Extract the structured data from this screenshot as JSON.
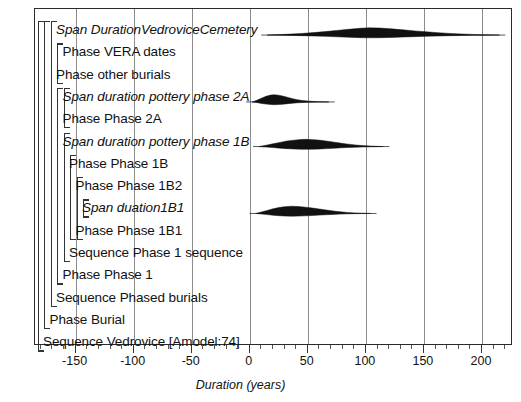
{
  "figure": {
    "kind": "oxcal-span-duration-plot",
    "axis": {
      "title": "Duration (years)",
      "min": -185,
      "max": 225,
      "major_ticks": [
        -150,
        -100,
        -50,
        0,
        50,
        100,
        150,
        200
      ],
      "major_tick_labels": [
        "-150",
        "-100",
        "-50",
        "0",
        "50",
        "100",
        "150",
        "200"
      ],
      "minor_tick_step": 10,
      "gridlines": true,
      "grid_color": "#8d8d8d",
      "frame_color": "#2b2b2b"
    },
    "rows": [
      {
        "label": "Span DurationVedroviceCemetery",
        "italic": true,
        "indent": 2,
        "has_dist": true,
        "dist": 0
      },
      {
        "label": "Phase VERA dates",
        "italic": false,
        "indent": 3,
        "has_dist": false
      },
      {
        "label": "Phase other burials",
        "italic": false,
        "indent": 2,
        "has_dist": false
      },
      {
        "label": "Span duration pottery phase 2A",
        "italic": true,
        "indent": 3,
        "has_dist": true,
        "dist": 1
      },
      {
        "label": "Phase Phase 2A",
        "italic": false,
        "indent": 3,
        "has_dist": false
      },
      {
        "label": "Span duration pottery phase 1B",
        "italic": true,
        "indent": 3,
        "has_dist": true,
        "dist": 2
      },
      {
        "label": "Phase Phase 1B",
        "italic": false,
        "indent": 4,
        "has_dist": false
      },
      {
        "label": "Phase Phase 1B2",
        "italic": false,
        "indent": 5,
        "has_dist": false
      },
      {
        "label": "Span duation1B1",
        "italic": true,
        "indent": 6,
        "has_dist": true,
        "dist": 3
      },
      {
        "label": "Phase Phase 1B1",
        "italic": false,
        "indent": 5,
        "has_dist": false
      },
      {
        "label": "Sequence Phase 1 sequence",
        "italic": false,
        "indent": 4,
        "has_dist": false
      },
      {
        "label": "Phase Phase 1",
        "italic": false,
        "indent": 3,
        "has_dist": false
      },
      {
        "label": "Sequence Phased burials",
        "italic": false,
        "indent": 2,
        "has_dist": false
      },
      {
        "label": "Phase Burial",
        "italic": false,
        "indent": 1,
        "has_dist": false
      },
      {
        "label": "Sequence Vedrovice [Amodel:74]",
        "italic": false,
        "indent": 0,
        "has_dist": false
      }
    ],
    "brackets": [
      {
        "level": 0,
        "first_row": 0,
        "last_row": 14
      },
      {
        "level": 1,
        "first_row": 0,
        "last_row": 13
      },
      {
        "level": 2,
        "first_row": 0,
        "last_row": 12
      },
      {
        "level": 3,
        "first_row": 1,
        "last_row": 2
      },
      {
        "level": 3,
        "first_row": 3,
        "last_row": 11
      },
      {
        "level": 4,
        "first_row": 3,
        "last_row": 4
      },
      {
        "level": 4,
        "first_row": 5,
        "last_row": 10
      },
      {
        "level": 5,
        "first_row": 6,
        "last_row": 9
      },
      {
        "level": 6,
        "first_row": 7,
        "last_row": 9
      },
      {
        "level": 7,
        "first_row": 8,
        "last_row": 8
      }
    ],
    "distributions": [
      {
        "name": "Span DurationVedroviceCemetery",
        "row": 0,
        "start": 15,
        "end": 215,
        "mode": 100,
        "color": "#111111",
        "points": [
          [
            15,
            0.0
          ],
          [
            25,
            0.06
          ],
          [
            35,
            0.13
          ],
          [
            45,
            0.22
          ],
          [
            55,
            0.34
          ],
          [
            65,
            0.48
          ],
          [
            75,
            0.64
          ],
          [
            85,
            0.8
          ],
          [
            95,
            0.94
          ],
          [
            103,
            1.0
          ],
          [
            112,
            0.97
          ],
          [
            122,
            0.86
          ],
          [
            132,
            0.72
          ],
          [
            142,
            0.58
          ],
          [
            152,
            0.45
          ],
          [
            162,
            0.33
          ],
          [
            172,
            0.23
          ],
          [
            182,
            0.15
          ],
          [
            192,
            0.09
          ],
          [
            202,
            0.04
          ],
          [
            215,
            0.0
          ]
        ]
      },
      {
        "name": "Span duration pottery phase 2A",
        "row": 3,
        "start": 2,
        "end": 68,
        "mode": 20,
        "color": "#111111",
        "points": [
          [
            2,
            0.0
          ],
          [
            6,
            0.22
          ],
          [
            10,
            0.52
          ],
          [
            14,
            0.78
          ],
          [
            18,
            0.95
          ],
          [
            21,
            1.0
          ],
          [
            25,
            0.94
          ],
          [
            29,
            0.8
          ],
          [
            33,
            0.62
          ],
          [
            37,
            0.45
          ],
          [
            41,
            0.31
          ],
          [
            45,
            0.21
          ],
          [
            50,
            0.13
          ],
          [
            55,
            0.07
          ],
          [
            60,
            0.03
          ],
          [
            68,
            0.0
          ]
        ]
      },
      {
        "name": "Span duration pottery phase 1B",
        "row": 5,
        "start": 8,
        "end": 115,
        "mode": 48,
        "color": "#111111",
        "points": [
          [
            8,
            0.0
          ],
          [
            14,
            0.18
          ],
          [
            20,
            0.38
          ],
          [
            26,
            0.58
          ],
          [
            32,
            0.76
          ],
          [
            38,
            0.89
          ],
          [
            44,
            0.98
          ],
          [
            49,
            1.0
          ],
          [
            55,
            0.96
          ],
          [
            61,
            0.87
          ],
          [
            67,
            0.74
          ],
          [
            73,
            0.6
          ],
          [
            79,
            0.46
          ],
          [
            85,
            0.33
          ],
          [
            91,
            0.22
          ],
          [
            97,
            0.13
          ],
          [
            104,
            0.07
          ],
          [
            110,
            0.03
          ],
          [
            115,
            0.0
          ]
        ]
      },
      {
        "name": "Span duation1B1",
        "row": 8,
        "start": 5,
        "end": 104,
        "mode": 36,
        "color": "#111111",
        "points": [
          [
            5,
            0.0
          ],
          [
            10,
            0.2
          ],
          [
            15,
            0.42
          ],
          [
            20,
            0.64
          ],
          [
            25,
            0.82
          ],
          [
            30,
            0.94
          ],
          [
            36,
            1.0
          ],
          [
            42,
            0.96
          ],
          [
            48,
            0.87
          ],
          [
            54,
            0.75
          ],
          [
            60,
            0.61
          ],
          [
            66,
            0.47
          ],
          [
            72,
            0.34
          ],
          [
            78,
            0.23
          ],
          [
            84,
            0.14
          ],
          [
            90,
            0.08
          ],
          [
            96,
            0.03
          ],
          [
            104,
            0.0
          ]
        ]
      }
    ]
  }
}
